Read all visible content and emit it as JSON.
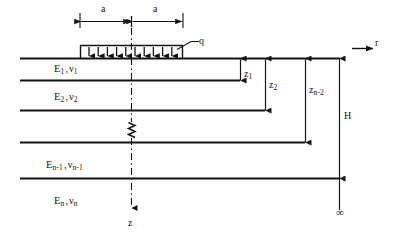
{
  "figure": {
    "background_color": "#ffffff",
    "line_color": "#141414",
    "text_color": "#141414"
  },
  "dimensions": {
    "half_width_left_label": "a",
    "half_width_right_label": "a"
  },
  "load": {
    "symbol": "q",
    "arrow_count": 11
  },
  "axes": {
    "radial_label": "r",
    "depth_label": "z"
  },
  "layers": [
    {
      "modulus": "E",
      "modulus_sub": "1",
      "poisson": "ν",
      "poisson_sub": "1",
      "separator": ","
    },
    {
      "modulus": "E",
      "modulus_sub": "2",
      "poisson": "ν",
      "poisson_sub": "2",
      "separator": ","
    },
    {
      "modulus": "E",
      "modulus_sub": "n-1",
      "poisson": "ν",
      "poisson_sub": "n-1",
      "separator": ","
    },
    {
      "modulus": "E",
      "modulus_sub": "n",
      "poisson": "ν",
      "poisson_sub": "n",
      "separator": ","
    }
  ],
  "depths": [
    {
      "symbol": "z",
      "sub": "1"
    },
    {
      "symbol": "z",
      "sub": "2"
    },
    {
      "symbol": "z",
      "sub": "n-2"
    }
  ],
  "total_depth": {
    "symbol": "H"
  },
  "infinity": {
    "symbol": "∞"
  },
  "break_symbol": {
    "name": "zigzag-break",
    "meaning": "omitted intermediate layers"
  }
}
